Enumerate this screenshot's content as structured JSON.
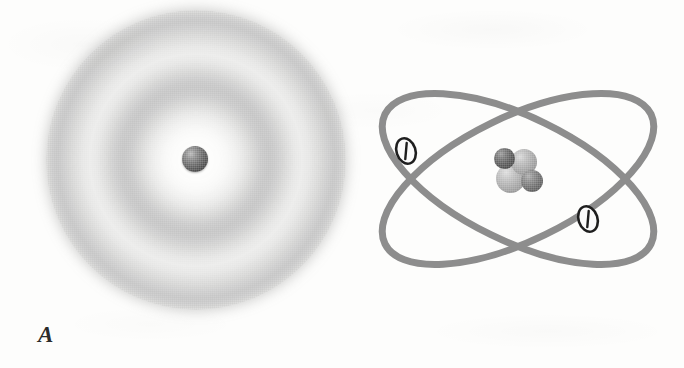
{
  "figure": {
    "background_color": "#fdfdfc",
    "width": 684,
    "height": 368,
    "kind": "two-panel atomic model comparison illustration"
  },
  "panels": [
    {
      "id": "A",
      "label": "A",
      "model_name": "electron cloud model",
      "description": "Diffuse concentric probability-density cloud surrounding a single central nucleus sphere",
      "cloud": {
        "center_x": 196,
        "center_y": 160,
        "outer_radius": 150,
        "ring_count": 2,
        "ring_radii": [
          50,
          103
        ],
        "color": "#6e6e6e",
        "edge": "soft / airbrushed"
      },
      "nucleus": {
        "shape": "sphere",
        "diameter": 26,
        "center_x": 195,
        "center_y": 159,
        "color": "#4a4a4a",
        "highlight_color": "#b9b9b9"
      }
    },
    {
      "id": "B",
      "label": "B",
      "model_name": "planetary / Bohr model",
      "description": "Two crossed elliptical electron orbits around a clustered nucleus of four nucleon spheres",
      "orbits": [
        {
          "name": "orbit-1",
          "rotation_deg": -26,
          "rx": 148,
          "ry": 62,
          "stroke_color": "#8d8d8d",
          "stroke_width": 7
        },
        {
          "name": "orbit-2",
          "rotation_deg": 26,
          "rx": 148,
          "ry": 62,
          "stroke_color": "#8d8d8d",
          "stroke_width": 7
        }
      ],
      "orbit_crossings": [
        {
          "x": 415,
          "y": 185
        },
        {
          "x": 612,
          "y": 168
        }
      ],
      "electrons": [
        {
          "name": "electron-left",
          "x": 406,
          "y": 151,
          "charge_sign": "negative",
          "marker": "outlined ellipse with diagonal slash",
          "outline_color": "#1e1e1e"
        },
        {
          "name": "electron-right",
          "x": 588,
          "y": 219,
          "charge_sign": "negative",
          "marker": "outlined ellipse with diagonal slash",
          "outline_color": "#1e1e1e"
        }
      ],
      "nucleus_cluster": {
        "particle_count": 4,
        "center_x": 520,
        "center_y": 172,
        "particles": [
          {
            "name": "nucleon-1",
            "tone": "dark",
            "diameter": 21,
            "color": "#5a5a5a"
          },
          {
            "name": "nucleon-2",
            "tone": "light",
            "diameter": 26,
            "color": "#a2a2a2"
          },
          {
            "name": "nucleon-3",
            "tone": "light",
            "diameter": 29,
            "color": "#a6a6a6"
          },
          {
            "name": "nucleon-4",
            "tone": "mid",
            "diameter": 22,
            "color": "#6c6c6c"
          }
        ]
      }
    }
  ]
}
